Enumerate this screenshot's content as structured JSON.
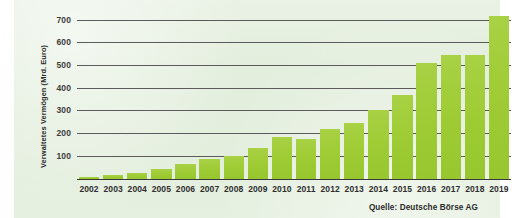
{
  "chart_data": {
    "type": "bar",
    "title": "",
    "subtitle": "",
    "xlabel": "",
    "ylabel": "Verwaltetes Vermögen (Mrd. Euro)",
    "categories": [
      "2002",
      "2003",
      "2004",
      "2005",
      "2006",
      "2007",
      "2008",
      "2009",
      "2010",
      "2011",
      "2012",
      "2013",
      "2014",
      "2015",
      "2016",
      "2017",
      "2018",
      "2019"
    ],
    "values": [
      5,
      15,
      25,
      40,
      65,
      85,
      100,
      135,
      185,
      175,
      220,
      245,
      300,
      368,
      508,
      545,
      542,
      718
    ],
    "series": [
      {
        "name": "Verwaltetes Vermögen",
        "values": [
          5,
          15,
          25,
          40,
          65,
          85,
          100,
          135,
          185,
          175,
          220,
          245,
          300,
          368,
          508,
          545,
          542,
          718
        ]
      }
    ],
    "ylim": [
      0,
      760
    ],
    "yticks": [
      100,
      200,
      300,
      400,
      500,
      600,
      700
    ],
    "ytick_labels": [
      "100",
      "200",
      "300",
      "400",
      "500",
      "600",
      "700"
    ],
    "xlim_categories": [
      "2002",
      "2019"
    ],
    "grid": "horizontal",
    "legend": "none",
    "bar_color": "#a2cd3a",
    "gridline_color": "#4f4f4f",
    "background_color": "#e3eedd",
    "text_color": "#2e2e2e",
    "annotations": []
  },
  "source": {
    "text": "Quelle: Deutsche Börse AG"
  },
  "axis": {
    "y_title": "Verwaltetes Vermögen (Mrd. Euro)"
  }
}
